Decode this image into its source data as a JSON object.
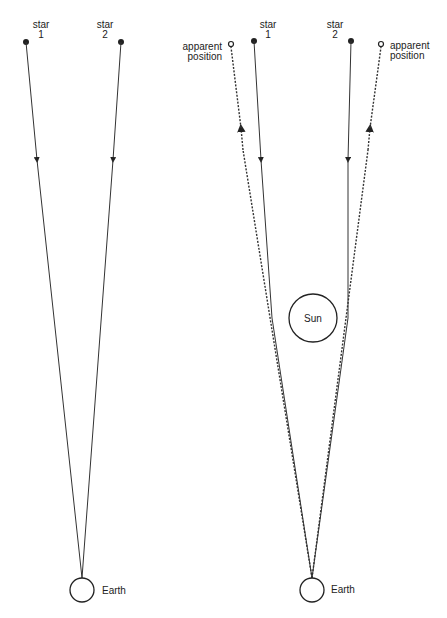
{
  "left_panel": {
    "star1": {
      "label_line1": "star",
      "label_line2": "1"
    },
    "star2": {
      "label_line1": "star",
      "label_line2": "2"
    },
    "earth_label": "Earth"
  },
  "right_panel": {
    "star1": {
      "label_line1": "star",
      "label_line2": "1"
    },
    "star2": {
      "label_line1": "star",
      "label_line2": "2"
    },
    "apparent_left": {
      "label_line1": "apparent",
      "label_line2": "position"
    },
    "apparent_right": {
      "label_line1": "apparent",
      "label_line2": "position"
    },
    "sun_label": "Sun",
    "earth_label": "Earth"
  },
  "colors": {
    "ink": "#222222",
    "background": "#ffffff"
  }
}
